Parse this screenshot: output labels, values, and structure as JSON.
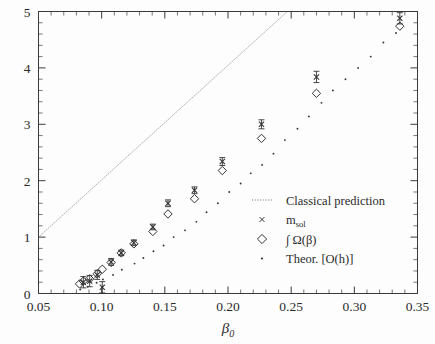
{
  "chart_data": {
    "type": "scatter",
    "title": "",
    "xlabel": "β₀",
    "ylabel": "",
    "xlim": [
      0.05,
      0.35
    ],
    "ylim": [
      0,
      5
    ],
    "xticks": [
      0.05,
      0.1,
      0.15,
      0.2,
      0.25,
      0.3,
      0.35
    ],
    "xtick_labels": [
      "0.05",
      "0.10",
      "0.15",
      "0.20",
      "0.25",
      "0.30",
      "0.35"
    ],
    "yticks": [
      0,
      1,
      2,
      3,
      4,
      5
    ],
    "ytick_labels": [
      "0",
      "1",
      "2",
      "3",
      "4",
      "5"
    ],
    "x_minor_step": 0.01,
    "y_minor_step": 0.2,
    "grid": false,
    "legend_position": "center-right",
    "series": [
      {
        "name": "Classical prediction",
        "marker": "dotted-line",
        "type": "line",
        "linestyle": "dotted",
        "x": [
          0.05,
          0.247
        ],
        "y": [
          1.0,
          5.0
        ],
        "comment": "straight dotted line from left axis at y=1 exiting top of frame"
      },
      {
        "name": "m_sol",
        "marker": "x",
        "type": "scatter-errorbar",
        "x": [
          0.0855,
          0.0905,
          0.0965,
          0.1005,
          0.1075,
          0.1155,
          0.1255,
          0.1405,
          0.1525,
          0.1735,
          0.1955,
          0.2265,
          0.27,
          0.336
        ],
        "y": [
          0.2,
          0.22,
          0.33,
          0.11,
          0.56,
          0.72,
          0.9,
          1.18,
          1.6,
          1.83,
          2.34,
          3.0,
          3.84,
          4.88
        ],
        "yerr": [
          0.1,
          0.1,
          0.08,
          0.1,
          0.06,
          0.05,
          0.05,
          0.05,
          0.06,
          0.06,
          0.07,
          0.08,
          0.1,
          0.1
        ]
      },
      {
        "name": "∫ Ω(β)",
        "marker": "diamond",
        "type": "scatter",
        "x": [
          0.0825,
          0.0855,
          0.0905,
          0.0965,
          0.1005,
          0.1075,
          0.1155,
          0.1255,
          0.1405,
          0.1525,
          0.1735,
          0.1955,
          0.2265,
          0.27,
          0.336
        ],
        "y": [
          0.17,
          0.22,
          0.26,
          0.35,
          0.43,
          0.55,
          0.72,
          0.88,
          1.1,
          1.41,
          1.68,
          2.18,
          2.75,
          3.55,
          4.74
        ]
      },
      {
        "name": "Theor. [O(h)]",
        "marker": "dot",
        "type": "scatter",
        "x": [
          0.083,
          0.089,
          0.096,
          0.101,
          0.109,
          0.116,
          0.126,
          0.133,
          0.141,
          0.149,
          0.157,
          0.166,
          0.175,
          0.183,
          0.192,
          0.201,
          0.21,
          0.218,
          0.227,
          0.236,
          0.245,
          0.255,
          0.264,
          0.274,
          0.283,
          0.293,
          0.303,
          0.313,
          0.323,
          0.333
        ],
        "y": [
          0.07,
          0.12,
          0.19,
          0.25,
          0.33,
          0.42,
          0.53,
          0.63,
          0.75,
          0.85,
          1.0,
          1.12,
          1.27,
          1.44,
          1.6,
          1.8,
          1.95,
          2.13,
          2.28,
          2.48,
          2.72,
          2.92,
          3.14,
          3.38,
          3.6,
          3.8,
          4.0,
          4.2,
          4.45,
          4.62
        ]
      }
    ],
    "legend_entries": [
      {
        "label": "Classical prediction",
        "marker": "dotted-line"
      },
      {
        "label": "m_sol",
        "label_main": "m",
        "label_sub": "sol",
        "marker": "x"
      },
      {
        "label": "∫ Ω(β)",
        "marker": "diamond"
      },
      {
        "label": "Theor. [O(h)]",
        "marker": "dot"
      }
    ]
  },
  "style": {
    "axis_color": "#3a3a3a",
    "text_color": "#2b2b2b",
    "marker_color": "#333333",
    "background": "#fdfdfd"
  }
}
